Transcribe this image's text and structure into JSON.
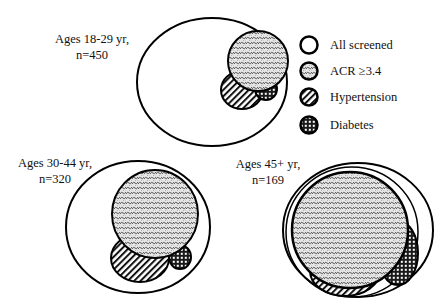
{
  "figure": {
    "type": "proportional-venn",
    "groups": [
      {
        "id": "g1",
        "label_line1": "Ages 18-29 yr,",
        "label_line2": "n=450",
        "label_x": 92,
        "label_y": 31,
        "all_screened": {
          "cx": 212,
          "cy": 82,
          "rx": 75,
          "ry": 64
        },
        "acr": {
          "cx": 258,
          "cy": 61,
          "rx": 30,
          "ry": 30
        },
        "hypertension": {
          "cx": 242,
          "cy": 90,
          "rx": 21,
          "ry": 19
        },
        "diabetes": {
          "cx": 266,
          "cy": 89,
          "rx": 11,
          "ry": 11
        }
      },
      {
        "id": "g2",
        "label_line1": "Ages 30-44 yr,",
        "label_line2": "n=320",
        "label_x": 55,
        "label_y": 155,
        "all_screened": {
          "cx": 138,
          "cy": 227,
          "rx": 72,
          "ry": 66
        },
        "acr": {
          "cx": 155,
          "cy": 214,
          "rx": 43,
          "ry": 44
        },
        "hypertension": {
          "cx": 140,
          "cy": 258,
          "rx": 29,
          "ry": 24
        },
        "diabetes": {
          "cx": 180,
          "cy": 257,
          "rx": 11,
          "ry": 12
        }
      },
      {
        "id": "g3",
        "label_line1": "Ages 45+ yr,",
        "label_line2": "n=169",
        "label_x": 268,
        "label_y": 156,
        "all_screened": {
          "cx": 358,
          "cy": 230,
          "rx": 75,
          "ry": 67
        },
        "acr": {
          "cx": 350,
          "cy": 230,
          "rx": 58,
          "ry": 58
        },
        "hypertension": {
          "cx": 345,
          "cy": 271,
          "rx": 35,
          "ry": 25
        },
        "diabetes": {
          "cx": 398,
          "cy": 253,
          "rx": 20,
          "ry": 32
        }
      }
    ],
    "legend": {
      "items": [
        {
          "key": "all_screened",
          "label": "All screened",
          "pattern": "none",
          "cy": 45
        },
        {
          "key": "acr",
          "label": "ACR ≥3.4",
          "pattern": "scale",
          "cy": 71
        },
        {
          "key": "hypertension",
          "label": "Hypertension",
          "pattern": "diagonal",
          "cy": 97
        },
        {
          "key": "diabetes",
          "label": "Diabetes",
          "pattern": "checker",
          "cy": 125
        }
      ],
      "swatch_cx": 309,
      "swatch_r": 9,
      "text_x": 330
    },
    "colors": {
      "stroke": "#000000",
      "background": "#ffffff"
    }
  }
}
